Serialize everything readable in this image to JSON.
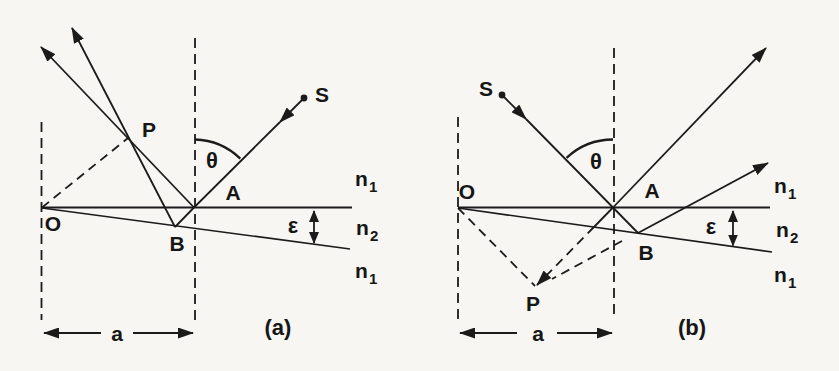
{
  "figure": {
    "type": "optics-wedge-film-fringe-localization-diagram",
    "colors": {
      "background": "#f7f6f2",
      "ink": "#1b1b1b"
    },
    "panel_a": {
      "caption": "(a)",
      "source_label": "S",
      "origin_label": "O",
      "localization_point_label": "P",
      "top_surface_point_label": "A",
      "bottom_surface_point_label": "B",
      "incidence_angle_label": "θ",
      "wedge_angle_label": "ε",
      "width_label": "a",
      "index_above": {
        "symbol": "n",
        "sub": "1"
      },
      "index_film": {
        "symbol": "n",
        "sub": "2"
      },
      "index_below": {
        "symbol": "n",
        "sub": "1"
      }
    },
    "panel_b": {
      "caption": "(b)",
      "source_label": "S",
      "origin_label": "O",
      "localization_point_label": "P",
      "top_surface_point_label": "A",
      "bottom_surface_point_label": "B",
      "incidence_angle_label": "θ",
      "wedge_angle_label": "ε",
      "width_label": "a",
      "index_above": {
        "symbol": "n",
        "sub": "1"
      },
      "index_film": {
        "symbol": "n",
        "sub": "2"
      },
      "index_below": {
        "symbol": "n",
        "sub": "1"
      }
    }
  }
}
